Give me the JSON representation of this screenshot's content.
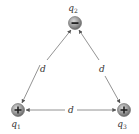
{
  "diagram": {
    "charges": [
      {
        "id": "q1",
        "label": "q",
        "subscript": "1",
        "sign": "+",
        "x": 18,
        "y": 110,
        "label_x": 18,
        "label_y": 127
      },
      {
        "id": "q2",
        "label": "q",
        "subscript": "2",
        "sign": "−",
        "x": 75,
        "y": 23,
        "label_x": 75,
        "label_y": 11
      },
      {
        "id": "q3",
        "label": "q",
        "subscript": "3",
        "sign": "+",
        "x": 124,
        "y": 110,
        "label_x": 124,
        "label_y": 127
      }
    ],
    "sides": [
      {
        "from": "q1",
        "to": "q2",
        "label": "d",
        "label_x": 43,
        "label_y": 72
      },
      {
        "from": "q2",
        "to": "q3",
        "label": "d",
        "label_x": 102,
        "label_y": 72
      },
      {
        "from": "q1",
        "to": "q3",
        "label": "d",
        "label_x": 71,
        "label_y": 113
      }
    ],
    "colors": {
      "line": "#777777",
      "charge_fill": "#9a9a9a",
      "charge_edge": "#666666",
      "text": "#333333"
    }
  }
}
